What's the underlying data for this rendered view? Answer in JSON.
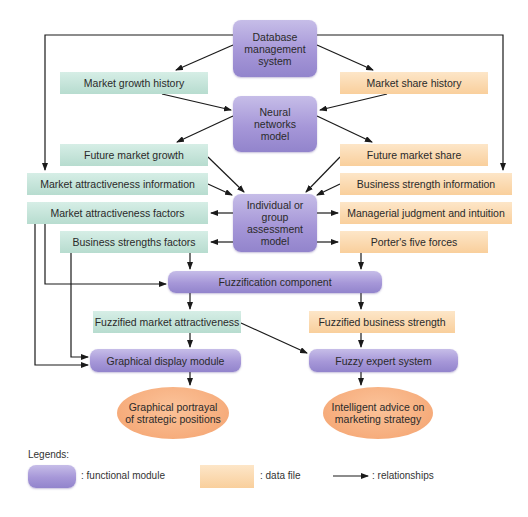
{
  "diagram": {
    "title": "",
    "modules": {
      "database": "Database management system",
      "neural": "Neural networks model",
      "assessment": "Individual or group assessment model",
      "fuzzification": "Fuzzification component",
      "graphical_display": "Graphical display module",
      "fuzzy_expert": "Fuzzy expert system"
    },
    "data_left": {
      "market_growth_history": "Market growth history",
      "future_market_growth": "Future market growth",
      "market_attractiveness_information": "Market attractiveness information",
      "market_attractiveness_factors": "Market attractiveness factors",
      "business_strengths_factors": "Business strengths factors",
      "fuzzified_market_attractiveness": "Fuzzified market attractiveness"
    },
    "data_right": {
      "market_share_history": "Market share history",
      "future_market_share": "Future market share",
      "business_strength_information": "Business strength information",
      "managerial_judgment": "Managerial judgment and intuition",
      "porters_five_forces": "Porter's five forces",
      "fuzzified_business_strength": "Fuzzified business strength"
    },
    "outputs": {
      "graphical_portrayal": "Graphical portrayal of strategic positions",
      "intelligent_advice": "Intelligent advice on marketing strategy"
    }
  },
  "legend": {
    "title": "Legends:",
    "functional_module": ": functional module",
    "data_file": ": data file",
    "relationships": ": relationships"
  },
  "colors": {
    "module": "#a697d8",
    "data_green": "#b7dccf",
    "data_orange": "#f9cf9c",
    "output": "#f4a26e",
    "arrow": "#1a1a1a"
  }
}
